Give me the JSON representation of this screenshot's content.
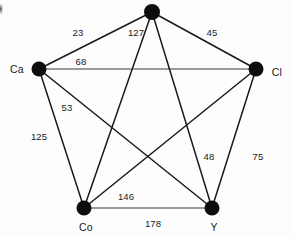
{
  "diagram": {
    "type": "graph",
    "background_color": "#fdfdfd",
    "node_color": "#0d0d0d",
    "edge_color": "#1a1a1a",
    "label_color": "#1a1a1a",
    "nodes": [
      {
        "id": "top",
        "label": "",
        "x": 152,
        "y": 12,
        "r": 8,
        "label_x": 152,
        "label_y": 12
      },
      {
        "id": "Ca",
        "label": "Ca",
        "x": 39,
        "y": 69,
        "r": 7.5,
        "label_x": 17,
        "label_y": 69
      },
      {
        "id": "Cl",
        "label": "Cl",
        "x": 256,
        "y": 69,
        "r": 7.5,
        "label_x": 277,
        "label_y": 72
      },
      {
        "id": "Co",
        "label": "Co",
        "x": 84,
        "y": 208,
        "r": 7.5,
        "label_x": 86,
        "label_y": 227
      },
      {
        "id": "Y",
        "label": "Y",
        "x": 212,
        "y": 208,
        "r": 7.5,
        "label_x": 214,
        "label_y": 227
      }
    ],
    "edges": [
      {
        "from": "top",
        "to": "Ca",
        "weight": "23",
        "label_x": 78,
        "label_y": 33
      },
      {
        "from": "top",
        "to": "Co",
        "weight": "127",
        "label_x": 136,
        "label_y": 33
      },
      {
        "from": "top",
        "to": "Cl",
        "weight": "45",
        "label_x": 212,
        "label_y": 33
      },
      {
        "from": "Ca",
        "to": "Cl",
        "weight": "68",
        "label_x": 81,
        "label_y": 62
      },
      {
        "from": "Ca",
        "to": "Y",
        "weight": "53",
        "label_x": 67,
        "label_y": 108
      },
      {
        "from": "Ca",
        "to": "Co",
        "weight": "125",
        "label_x": 39,
        "label_y": 137
      },
      {
        "from": "top",
        "to": "Y",
        "weight": "48",
        "label_x": 209,
        "label_y": 157
      },
      {
        "from": "Cl",
        "to": "Y",
        "weight": "75",
        "label_x": 258,
        "label_y": 157
      },
      {
        "from": "Cl",
        "to": "Co",
        "weight": "146",
        "label_x": 126,
        "label_y": 197
      },
      {
        "from": "Co",
        "to": "Y",
        "weight": "178",
        "label_x": 153,
        "label_y": 224
      }
    ]
  },
  "chart_data": {
    "type": "graph",
    "node_labels": [
      "Ca",
      "Cl",
      "Co",
      "Y"
    ],
    "edge_weights": [
      23,
      127,
      45,
      68,
      53,
      125,
      48,
      75,
      146,
      178
    ],
    "edge_list": [
      [
        "top",
        "Ca",
        23
      ],
      [
        "top",
        "Co",
        127
      ],
      [
        "top",
        "Cl",
        45
      ],
      [
        "Ca",
        "Cl",
        68
      ],
      [
        "Ca",
        "Y",
        53
      ],
      [
        "Ca",
        "Co",
        125
      ],
      [
        "top",
        "Y",
        48
      ],
      [
        "Cl",
        "Y",
        75
      ],
      [
        "Cl",
        "Co",
        146
      ],
      [
        "Co",
        "Y",
        178
      ]
    ]
  }
}
